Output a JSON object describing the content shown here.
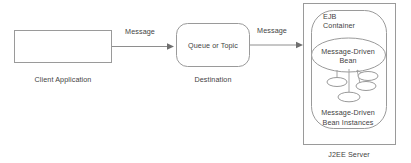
{
  "diagram": {
    "background_color": "#ffffff",
    "stroke_color": "#9a9a9a",
    "text_color": "#3f3f3f",
    "nodes": {
      "client": {
        "shape_name": "client-application-box",
        "caption": "Client Application"
      },
      "destination": {
        "shape_name": "queue-or-topic-box",
        "label": "Queue or Topic",
        "caption": "Destination"
      },
      "server": {
        "shape_name": "j2ee-server-box",
        "caption": "J2EE Server"
      },
      "ejb_container": {
        "shape_name": "ejb-container-box",
        "label_line1": "EJB",
        "label_line2": "Container"
      },
      "mdb": {
        "shape_name": "message-driven-bean-ellipse",
        "label_line1": "Message-Driven",
        "label_line2": "Bean"
      },
      "mdb_instances": {
        "shape_name": "message-driven-bean-instances",
        "label_line1": "Message-Driven",
        "label_line2": "Bean Instances",
        "instance_count": 4
      }
    },
    "edges": [
      {
        "name": "client-to-destination",
        "label": "Message",
        "from": "client",
        "to": "destination"
      },
      {
        "name": "destination-to-server",
        "label": "Message",
        "from": "destination",
        "to": "server"
      }
    ]
  }
}
